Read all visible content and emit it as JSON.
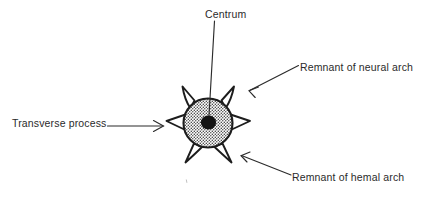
{
  "figure": {
    "background_color": "#ffffff",
    "ink_color": "#2b2b2b",
    "labels": {
      "centrum": "Centrum",
      "neural_arch": "Remnant of neural arch",
      "hemal_arch": "Remnant of hemal arch",
      "transverse_process": "Transverse process"
    },
    "parts": {
      "centrum_core": "centrum-core",
      "centrum_body": "stippled-centrum-body",
      "processes": "radiating-processes"
    },
    "leaders": {
      "centrum": "vertical-leader-line",
      "neural_arch": "diagonal-arrow-down-left",
      "hemal_arch": "diagonal-arrow-up-left",
      "transverse_process": "horizontal-arrow-right"
    },
    "geometry": {
      "center_x": 208,
      "center_y": 123,
      "body_radius": 25,
      "core_radius": 7,
      "process_count": 6
    }
  }
}
